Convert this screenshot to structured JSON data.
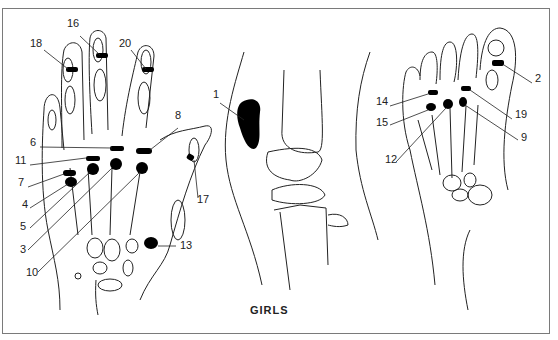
{
  "figure": {
    "caption": "GIRLS",
    "panels": [
      {
        "name": "hand",
        "labels": [
          {
            "id": "18",
            "x": 30,
            "y": 44
          },
          {
            "id": "16",
            "x": 67,
            "y": 24
          },
          {
            "id": "20",
            "x": 119,
            "y": 44
          },
          {
            "id": "8",
            "x": 175,
            "y": 116
          },
          {
            "id": "6",
            "x": 30,
            "y": 143
          },
          {
            "id": "11",
            "x": 15,
            "y": 161
          },
          {
            "id": "7",
            "x": 18,
            "y": 183
          },
          {
            "id": "4",
            "x": 22,
            "y": 205
          },
          {
            "id": "5",
            "x": 20,
            "y": 227
          },
          {
            "id": "3",
            "x": 20,
            "y": 250
          },
          {
            "id": "10",
            "x": 26,
            "y": 273
          },
          {
            "id": "17",
            "x": 197,
            "y": 200
          },
          {
            "id": "13",
            "x": 180,
            "y": 246
          }
        ]
      },
      {
        "name": "knee",
        "labels": [
          {
            "id": "1",
            "x": 213,
            "y": 95
          }
        ]
      },
      {
        "name": "foot",
        "labels": [
          {
            "id": "2",
            "x": 535,
            "y": 79
          },
          {
            "id": "14",
            "x": 376,
            "y": 102
          },
          {
            "id": "19",
            "x": 515,
            "y": 115
          },
          {
            "id": "15",
            "x": 376,
            "y": 123
          },
          {
            "id": "9",
            "x": 521,
            "y": 138
          },
          {
            "id": "12",
            "x": 385,
            "y": 160
          }
        ]
      }
    ]
  }
}
